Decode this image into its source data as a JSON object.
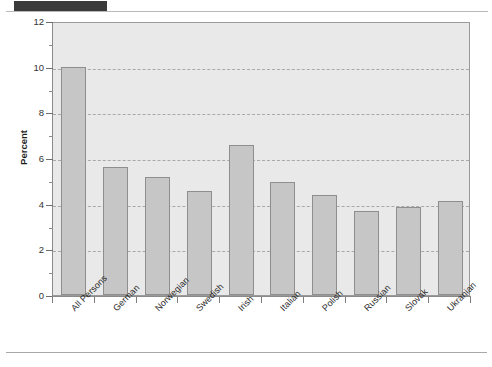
{
  "chart_data": {
    "type": "bar",
    "title": "",
    "xlabel": "",
    "ylabel": "Percent",
    "ylim": [
      0,
      12
    ],
    "ytick_step": 2,
    "yticks": [
      0,
      2,
      4,
      6,
      8,
      10,
      12
    ],
    "ytick_labels": [
      "0",
      "2",
      "4",
      "6",
      "8",
      "10",
      "12"
    ],
    "minor_yticks": [
      1,
      3,
      5,
      7,
      9,
      11
    ],
    "grid": true,
    "grid_axis": "y",
    "grid_style": "dashed",
    "legend": null,
    "categories": [
      "All Persons",
      "German",
      "Norwegian",
      "Swedish",
      "Irish",
      "Italian",
      "Polish",
      "Russian",
      "Slovak",
      "Ukranian"
    ],
    "values": [
      10.0,
      5.6,
      5.15,
      4.55,
      6.55,
      4.95,
      4.4,
      3.7,
      3.85,
      4.1
    ],
    "bar_color": "#c6c6c6",
    "bar_edge_color": "#8e8e8e",
    "plot_background": "#e9e9e9",
    "tick_label_rotation": -45
  },
  "decor": {
    "header_band_color": "#3a3a3a",
    "rule_color": "#b9b9b9"
  }
}
